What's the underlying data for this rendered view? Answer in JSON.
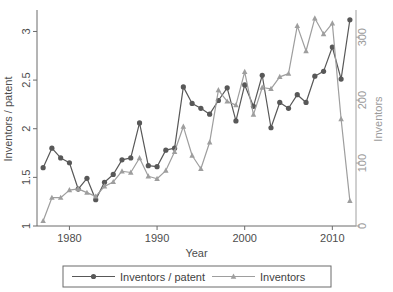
{
  "chart_data": {
    "type": "line",
    "title": "",
    "xlabel": "Year",
    "ylabel": "Inventors / patent",
    "ylabel_right": "Inventors",
    "x": [
      1977,
      1978,
      1979,
      1980,
      1981,
      1982,
      1983,
      1984,
      1985,
      1986,
      1987,
      1988,
      1989,
      1990,
      1991,
      1992,
      1993,
      1994,
      1995,
      1996,
      1997,
      1998,
      1999,
      2000,
      2001,
      2002,
      2003,
      2004,
      2005,
      2006,
      2007,
      2008,
      2009,
      2010,
      2011,
      2012
    ],
    "xlim": [
      1976.3,
      2012.7
    ],
    "ylim": [
      1.0,
      3.2
    ],
    "ylim_right": [
      0,
      340
    ],
    "xticks": [
      1980,
      1990,
      2000,
      2010
    ],
    "xticklabels": [
      "1980",
      "1990",
      "2000",
      "2010"
    ],
    "yticks": [
      1,
      1.5,
      2,
      2.5,
      3
    ],
    "yticklabels": [
      "1",
      "1.5",
      "2",
      "2.5",
      "3"
    ],
    "yticks_right": [
      0,
      100,
      200,
      300
    ],
    "yticklabels_right": [
      "0",
      "100",
      "200",
      "300"
    ],
    "grid": false,
    "legend_position": "bottom",
    "series": [
      {
        "name": "Inventors / patent",
        "axis": "left",
        "marker": "circle",
        "color": "#585858",
        "values": [
          1.6,
          1.8,
          1.7,
          1.65,
          1.38,
          1.49,
          1.27,
          1.45,
          1.53,
          1.68,
          1.7,
          2.06,
          1.62,
          1.61,
          1.78,
          1.8,
          2.43,
          2.26,
          2.21,
          2.15,
          2.29,
          2.42,
          2.08,
          2.45,
          2.23,
          2.55,
          2.01,
          2.27,
          2.21,
          2.35,
          2.27,
          2.54,
          2.59,
          2.84,
          2.51,
          3.12
        ]
      },
      {
        "name": "Inventors",
        "axis": "right",
        "marker": "triangle",
        "color": "#9e9e9e",
        "values": [
          8,
          45,
          45,
          57,
          59,
          53,
          47,
          63,
          70,
          87,
          85,
          108,
          79,
          75,
          88,
          118,
          158,
          112,
          91,
          133,
          216,
          198,
          192,
          245,
          177,
          220,
          218,
          237,
          242,
          318,
          278,
          330,
          305,
          322,
          170,
          40
        ]
      }
    ]
  },
  "legend": {
    "items": [
      {
        "label": "Inventors / patent",
        "marker": "circle",
        "color": "#585858"
      },
      {
        "label": "Inventors",
        "marker": "triangle",
        "color": "#9e9e9e"
      }
    ]
  }
}
